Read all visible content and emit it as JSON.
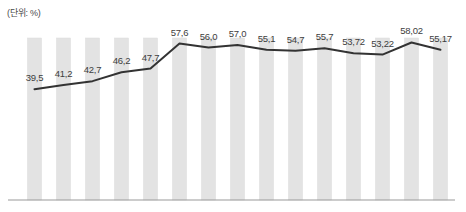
{
  "chart": {
    "unit_label": "(단위: %)",
    "colors": {
      "bar": "#e3e3e3",
      "bar_edge": "#dcdcdc",
      "line": "#333333",
      "axis": "#9a9a9a",
      "label_text": "#3d3d3d",
      "unit_text": "#4a4a4a",
      "background": "#ffffff"
    }
  },
  "chart_data": {
    "type": "line",
    "title": "",
    "subtitle": "",
    "xlabel": "",
    "ylabel": "",
    "unit": "%",
    "grid": false,
    "legend": false,
    "legend_position": "none",
    "axis_ticks_visible": false,
    "xtick_labels": [],
    "ylim": [
      0,
      62
    ],
    "categories": [
      "",
      "",
      "",
      "",
      "",
      "",
      "",
      "",
      "",
      "",
      "",
      "",
      "",
      "",
      ""
    ],
    "values": [
      39.5,
      41.2,
      42.7,
      46.2,
      47.7,
      57.6,
      56.0,
      57.0,
      55.1,
      54.7,
      55.7,
      53.72,
      53.22,
      58.02,
      55.17
    ],
    "data_labels": [
      "39,5",
      "41,2",
      "42,7",
      "46,2",
      "47,7",
      "57,6",
      "56,0",
      "57,0",
      "55,1",
      "54,7",
      "55,7",
      "53,72",
      "53,22",
      "58,02",
      "55,17"
    ],
    "series": [
      {
        "name": "",
        "values": [
          39.5,
          41.2,
          42.7,
          46.2,
          47.7,
          57.6,
          56.0,
          57.0,
          55.1,
          54.7,
          55.7,
          53.72,
          53.22,
          58.02,
          55.17
        ]
      }
    ],
    "background_bars": {
      "count": 15,
      "uniform_height": true,
      "description": "light gray vertical backdrop columns behind the line"
    }
  }
}
